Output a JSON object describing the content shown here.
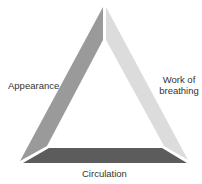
{
  "diagram": {
    "type": "assessment-triangle",
    "sides": [
      {
        "id": "appearance",
        "label": "Appearance",
        "position": "left",
        "color": "#9a9a9a"
      },
      {
        "id": "work_of_breathing",
        "label_line1": "Work of",
        "label_line2": "breathing",
        "position": "right",
        "color": "#dcdcdc"
      },
      {
        "id": "circulation",
        "label": "Circulation",
        "position": "bottom",
        "color": "#5c5c5c"
      }
    ]
  }
}
